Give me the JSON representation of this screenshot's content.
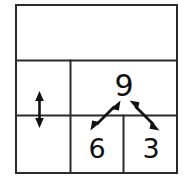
{
  "figure": {
    "background_color": "#ffffff",
    "line_color": "#2b2b2b",
    "ink_color": "#111111"
  },
  "table": {
    "outer": {
      "x": 15,
      "y": 4,
      "width": 163,
      "height": 170
    },
    "row_dividers_y": [
      60,
      115
    ],
    "column_dividers": [
      {
        "x": 70,
        "y1": 60,
        "y2": 174
      },
      {
        "x": 123,
        "y1": 115,
        "y2": 174
      }
    ],
    "cells": [
      {
        "name": "top-banner-cell",
        "row": 1,
        "col": 1,
        "text": ""
      },
      {
        "name": "middle-left-cell",
        "row": 2,
        "col": 1,
        "text": ""
      },
      {
        "name": "middle-right-cell",
        "row": 2,
        "col": 2,
        "text": "9"
      },
      {
        "name": "bottom-left-cell",
        "row": 3,
        "col": 1,
        "text": ""
      },
      {
        "name": "bottom-middle-cell",
        "row": 3,
        "col": 2,
        "text": "6"
      },
      {
        "name": "bottom-right-cell",
        "row": 3,
        "col": 3,
        "text": "3"
      }
    ]
  },
  "numbers": {
    "whole": "9",
    "part_left": "6",
    "part_right": "3"
  },
  "annotations": {
    "vertical_double_arrow": {
      "label": "vertical double-headed arrow",
      "x": 39,
      "y_top": 92,
      "y_bottom": 127
    },
    "left_diagonal_double_arrow": {
      "label": "diagonal double-headed arrow from 6 up to 9",
      "x1": 92,
      "y1": 129,
      "x2": 119,
      "y2": 102
    },
    "right_diagonal_double_arrow": {
      "label": "diagonal double-headed arrow from 9 down to 3",
      "x1": 131,
      "y1": 102,
      "x2": 158,
      "y2": 129
    }
  }
}
